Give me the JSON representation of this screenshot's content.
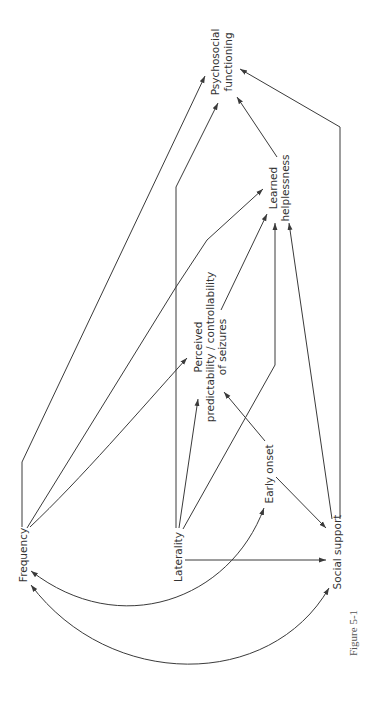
{
  "diagram": {
    "type": "path-diagram",
    "orientation": "rotated-90-ccw",
    "nodes": {
      "frequency": "Frequency",
      "laterality": "Laterality",
      "early_onset": "Early onset",
      "social_support": "Social support",
      "perceived_1": "Perceived",
      "perceived_2": "predictability / controllability",
      "perceived_3": "of  seizures",
      "learned_1": "Learned",
      "learned_2": "helplessness",
      "psychosocial_1": "Psychosocial",
      "psychosocial_2": "functioning"
    },
    "edges": [
      {
        "from": "Frequency",
        "to": "Psychosocial functioning"
      },
      {
        "from": "Frequency",
        "to": "Learned helplessness"
      },
      {
        "from": "Frequency",
        "to": "Perceived predictability / controllability of seizures"
      },
      {
        "from": "Laterality",
        "to": "Psychosocial functioning"
      },
      {
        "from": "Laterality",
        "to": "Perceived predictability / controllability of seizures"
      },
      {
        "from": "Laterality",
        "to": "Learned helplessness"
      },
      {
        "from": "Laterality",
        "to": "Social support"
      },
      {
        "from": "Early onset",
        "to": "Perceived predictability / controllability of seizures"
      },
      {
        "from": "Early onset",
        "to": "Social support"
      },
      {
        "from": "Perceived predictability / controllability of seizures",
        "to": "Learned helplessness"
      },
      {
        "from": "Learned helplessness",
        "to": "Psychosocial functioning"
      },
      {
        "from": "Social support",
        "to": "Learned helplessness"
      },
      {
        "from": "Social support",
        "to": "Psychosocial functioning"
      },
      {
        "from": "Early onset",
        "to": "Frequency",
        "type": "curved-bidirectional"
      },
      {
        "from": "Social support",
        "to": "Frequency",
        "type": "curved-bidirectional"
      }
    ]
  },
  "caption": "Figure 5-1"
}
